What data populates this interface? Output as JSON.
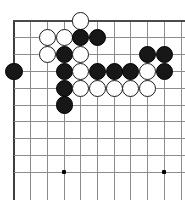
{
  "diagram": {
    "board_type": "go-board",
    "view": "upper-left corner section",
    "columns": 11,
    "rows": 10,
    "grid": {
      "origin_x": 14,
      "origin_y": 21,
      "spacing_x": 16.7,
      "spacing_y": 16.8,
      "left_edge_thick": true,
      "top_edge_thick": true,
      "line_color": "#8c8c8c",
      "edge_color": "#3d3d3d",
      "background": "#ffffff"
    },
    "stone_radius": 8.6,
    "colors": {
      "black_stone": "#171717",
      "white_stone": "#ffffff",
      "stone_outline": "#1a1a1a",
      "hoshi": "#000000"
    },
    "hoshi_points": [
      {
        "col": 3,
        "row": 9
      },
      {
        "col": 9,
        "row": 9
      }
    ],
    "stones": [
      {
        "col": 4,
        "row": 0,
        "color": "white"
      },
      {
        "col": 2,
        "row": 1,
        "color": "white"
      },
      {
        "col": 3,
        "row": 1,
        "color": "white"
      },
      {
        "col": 4,
        "row": 1,
        "color": "black"
      },
      {
        "col": 5,
        "row": 1,
        "color": "black"
      },
      {
        "col": 2,
        "row": 2,
        "color": "white"
      },
      {
        "col": 3,
        "row": 2,
        "color": "black"
      },
      {
        "col": 4,
        "row": 2,
        "color": "white"
      },
      {
        "col": 8,
        "row": 2,
        "color": "black"
      },
      {
        "col": 9,
        "row": 2,
        "color": "black"
      },
      {
        "col": 0,
        "row": 3,
        "color": "black"
      },
      {
        "col": 3,
        "row": 3,
        "color": "black"
      },
      {
        "col": 4,
        "row": 3,
        "color": "white"
      },
      {
        "col": 5,
        "row": 3,
        "color": "black"
      },
      {
        "col": 6,
        "row": 3,
        "color": "black"
      },
      {
        "col": 7,
        "row": 3,
        "color": "black"
      },
      {
        "col": 8,
        "row": 3,
        "color": "white"
      },
      {
        "col": 9,
        "row": 3,
        "color": "black"
      },
      {
        "col": 3,
        "row": 4,
        "color": "black"
      },
      {
        "col": 4,
        "row": 4,
        "color": "white"
      },
      {
        "col": 5,
        "row": 4,
        "color": "white"
      },
      {
        "col": 6,
        "row": 4,
        "color": "white"
      },
      {
        "col": 7,
        "row": 4,
        "color": "white"
      },
      {
        "col": 8,
        "row": 4,
        "color": "white"
      },
      {
        "col": 3,
        "row": 5,
        "color": "black"
      }
    ],
    "stone_counts": {
      "black": 14,
      "white": 13,
      "total": 27
    }
  }
}
